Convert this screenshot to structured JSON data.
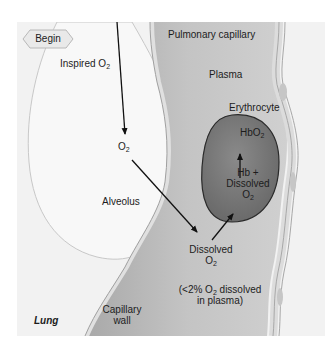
{
  "diagram": {
    "title_region": "Lung",
    "begin_button": {
      "label": "Begin"
    },
    "labels": {
      "inspired_o2": {
        "text": "Inspired O",
        "sub": "2"
      },
      "o2_alveolus": {
        "text": "O",
        "sub": "2"
      },
      "alveolus": "Alveolus",
      "pulmonary_capillary": "Pulmonary capillary",
      "plasma": "Plasma",
      "erythrocyte": "Erythrocyte",
      "hbo2": {
        "text": "HbO",
        "sub": "2"
      },
      "hb_plus": "Hb +",
      "dissolved_rbc_line1": "Dissolved",
      "dissolved_rbc_line2": {
        "text": "O",
        "sub": "2"
      },
      "dissolved_plasma_line1": "Dissolved",
      "dissolved_plasma_line2": {
        "text": "O",
        "sub": "2"
      },
      "percent_note_line1_pre": "(<2% O",
      "percent_note_line1_sub": "2",
      "percent_note_line1_post": " dissolved",
      "percent_note_line2": "in plasma)",
      "capillary_wall_line1": "Capillary",
      "capillary_wall_line2": "wall",
      "lung": "Lung"
    },
    "colors": {
      "background": "#f2f2f2",
      "alveolus_fill": "#f7f7f7",
      "capillary_fill": "#bdbdbd",
      "erythrocyte_fill": "#7a7a7a",
      "wall_fill": "#d9d9d9",
      "arrow": "#111111"
    }
  }
}
